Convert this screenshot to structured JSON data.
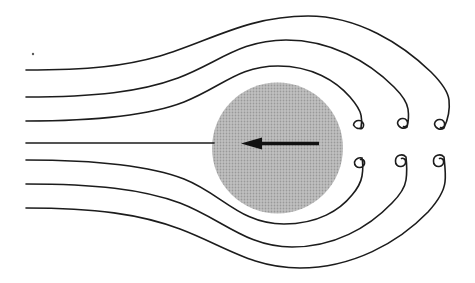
{
  "figure": {
    "canvas": {
      "width": 475,
      "height": 283,
      "background": "#ffffff"
    },
    "stroke_color": "#1c1c1c",
    "stroke_width": 1.6,
    "sphere": {
      "cx": 277.5,
      "cy": 148,
      "r": 65.5,
      "halftone_bg": "#c1c1c1",
      "halftone_dot": "#999999"
    },
    "velocity_arrow": {
      "color": "#111111",
      "shaft": {
        "x1": 319,
        "y1": 143.5,
        "x2": 260,
        "y2": 143.5,
        "width": 3.6
      },
      "head_points": "241,143.5 262,137.6 262,149.4"
    },
    "speck": {
      "cx": 33,
      "cy": 54,
      "r": 1.2,
      "fill": "#5a5a5a"
    },
    "streamlines": [
      {
        "name": "streamline-top-outer",
        "d": "M 26 70 C 90 70 125 66 160 56 C 210 41 248 16 308 16 C 358 16 402 44 431 72 C 441 82 448 91 449 100 C 450 109 449 117 444 128 A 6 6 0 0 1 434.5 124 A 5 5 0 0 1 440 119.5 A 4.5 4.5 0 0 1 444.5 125 A 3 3 0 0 1 440.5 127.5"
      },
      {
        "name": "streamline-top-middle",
        "d": "M 26 97 C 95 97 140 92 178 78 C 218 63 240 40 286 40 C 330 40 368 61 394 87 C 402 95 407 102 408 109 C 409 116 409 120 407 127 A 6 6 0 0 1 397.5 123 A 5 5 0 0 1 403 118.5 A 4.5 4.5 0 0 1 407.5 124 A 3 3 0 0 1 403.5 126.5"
      },
      {
        "name": "streamline-top-inner",
        "d": "M 26 121 C 95 121 148 116 184 102 C 222 87 238 66 278 66 C 312 66 336 81 350 97 C 356 104 360 110 361 115 C 362 119 362 123 361 128 A 6 6 0 0 1 353.5 125 A 5 5 0 0 1 359 120.5 A 4.5 4.5 0 0 1 363.5 126 A 3 3 0 0 1 359.5 128.5"
      },
      {
        "name": "streamline-center-stagnation",
        "d": "M 26 143 L 214 143"
      },
      {
        "name": "streamline-bottom-inner",
        "d": "M 26 160 C 95 160 148 165 184 179 C 222 194 240 224 284 224 C 318 224 340 210 352 195 C 358 188 361 182 362 176 C 363 170 363 163 362 158 A 6 6 0 0 0 354.5 162 A 5 5 0 0 0 360 167.5 A 4.5 4.5 0 0 0 364.5 162 A 3 3 0 0 0 360.5 159.5"
      },
      {
        "name": "streamline-bottom-middle",
        "d": "M 26 184 C 95 184 142 189 180 203 C 222 219 246 247 292 247 C 334 247 368 228 392 203 C 400 195 405 187 406 180 C 407 173 407 166 406 157 A 6 6 0 0 0 395.5 161 A 5 5 0 0 0 401 166.5 A 4.5 4.5 0 0 0 405.5 161 A 3 3 0 0 0 401.5 158.5"
      },
      {
        "name": "streamline-bottom-outer",
        "d": "M 26 208 C 95 208 140 214 180 229 C 225 246 252 268 300 268 C 352 268 398 243 428 212 C 438 201 444 191 445 182 C 446 174 445 167 444 157 A 6 6 0 0 0 433.5 161 A 5 5 0 0 0 439 166.5 A 4.5 4.5 0 0 0 443.5 161 A 3 3 0 0 0 439.5 158.5"
      }
    ]
  }
}
